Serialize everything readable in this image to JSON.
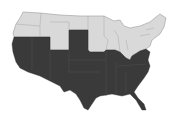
{
  "map": {
    "title": "United States map",
    "regions": [
      {
        "name": "northern-states",
        "fill": "#d9d9d9",
        "label": ""
      },
      {
        "name": "southern-states",
        "fill": "#3a3a3a",
        "label": ""
      }
    ],
    "colors": {
      "background": "#ffffff",
      "dark_fill": "#3a3a3a",
      "light_fill": "#d9d9d9",
      "border": "#9a9a9a"
    }
  }
}
